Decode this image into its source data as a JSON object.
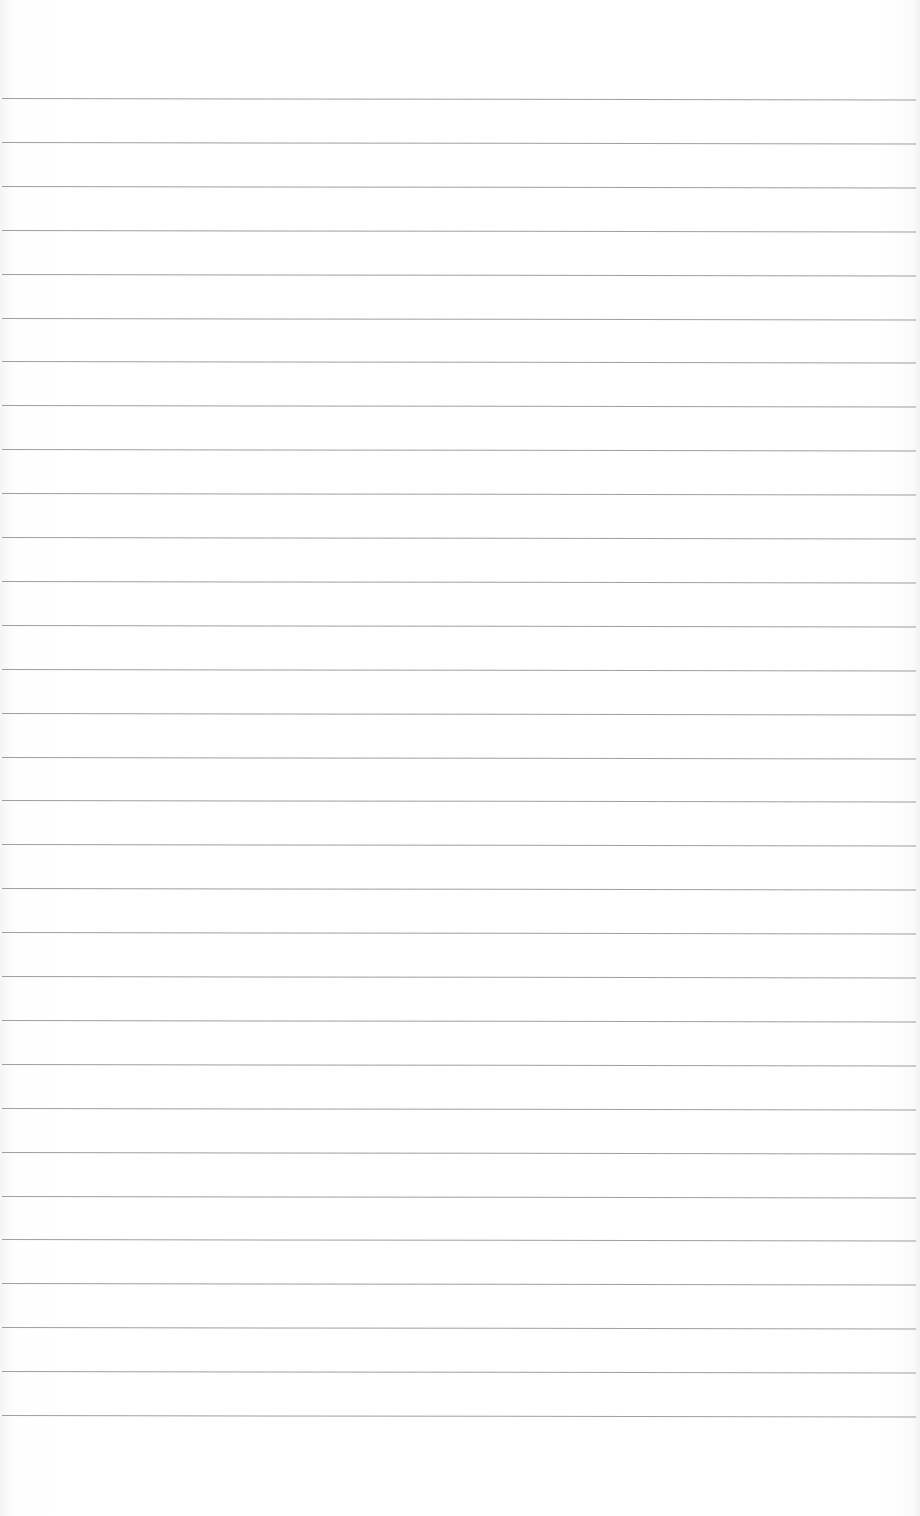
{
  "document": {
    "type": "ruled-paper",
    "text": "",
    "line_count": 31,
    "first_line_y": 98,
    "line_spacing_px": 43.9,
    "line_color": "#8e8e8e",
    "paper_color": "#ffffff"
  }
}
